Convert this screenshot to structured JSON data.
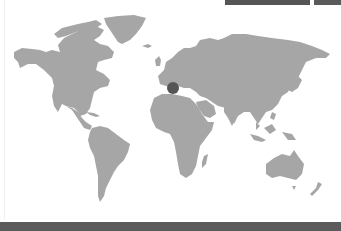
{
  "map": {
    "type": "world",
    "land_color": "#a6a6a6",
    "ocean_color": "#ffffff",
    "marker": {
      "label": "Central Europe",
      "color": "#555555"
    }
  },
  "top_bar": {
    "segment_color": "#555555"
  },
  "footer": {
    "color": "#5b5b5b"
  }
}
